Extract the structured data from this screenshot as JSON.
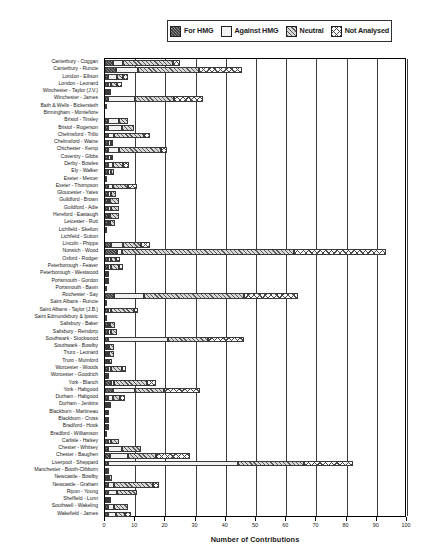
{
  "chart_data": {
    "type": "bar",
    "orientation": "horizontal",
    "stacked": true,
    "title": "",
    "xlabel": "Number of Contributions",
    "ylabel": "",
    "xlim": [
      0,
      100
    ],
    "xticks": [
      0,
      10,
      20,
      30,
      40,
      50,
      60,
      70,
      80,
      90,
      100
    ],
    "grid": true,
    "legend_position": "top",
    "series": [
      {
        "name": "For HMG",
        "key": "for",
        "pattern": "dark-hatch"
      },
      {
        "name": "Against HMG",
        "key": "against",
        "pattern": "light-dots"
      },
      {
        "name": "Neutral",
        "key": "neutral",
        "pattern": "diagonal-hatch"
      },
      {
        "name": "Not Analysed",
        "key": "notan",
        "pattern": "cross-hatch"
      }
    ],
    "categories": [
      "Canterbury - Coggan",
      "Canterbury - Runcie",
      "London - Ellison",
      "London - Leonard",
      "Winchester - Taylor (J.V.)",
      "Winchester - James",
      "Bath & Wells - Bickersteth",
      "Birmingham - Montefiore",
      "Bristol - Tinsley",
      "Bristol - Rogerson",
      "Chelmsford - Trillo",
      "Chelmsford - Waine",
      "Chichester - Kemp",
      "Coventry - Gibbs",
      "Derby - Bowles",
      "Ely - Walker",
      "Exeter - Mercer",
      "Exeter - Thompson",
      "Gloucester - Yates",
      "Guildford - Brown",
      "Guildford - Adie",
      "Hereford - Eastaugh",
      "Leicester - Rutt",
      "Lichfield - Skelton",
      "Lichfield - Sutton",
      "Lincoln - Phipps",
      "Norwich - Wood",
      "Oxford - Rodger",
      "Peterborough - Feaver",
      "Peterborough - Westwood",
      "Portsmouth - Gordon",
      "Portsmouth - Bavin",
      "Rochester - Say",
      "Saint Albans - Runcie",
      "Saint Albans - Taylor (J.B.)",
      "Saint Edmundsbury & Ipswic",
      "Salisbury - Baker",
      "Salisbury - Reindorp",
      "Southwark - Stockwood",
      "Southwark - Bowlby",
      "Truro - Leonard",
      "Truro - Mumford",
      "Worcester - Woods",
      "Worcester - Goodrich",
      "York - Blanch",
      "York - Habgood",
      "Durham - Habgood",
      "Durham - Jenkins",
      "Blackburn - Martineau",
      "Blackburn - Cross",
      "Bradford - Hook",
      "Bradford - Williamson",
      "Carlisle - Halsey",
      "Chester - Whitsey",
      "Chester - Baughen",
      "Liverpool - Sheppard",
      "Manchester - Booth-Clibborn",
      "Newcastle - Bowlby",
      "Newcastle - Graham",
      "Ripon - Young",
      "Sheffield - Lunn",
      "Southwell - Wakeling",
      "Wakefield - James"
    ],
    "rows": [
      {
        "category": "Canterbury - Coggan",
        "for": 2.5,
        "against": 3.5,
        "neutral": 16.5,
        "notan": 2.5,
        "total": 25.0
      },
      {
        "category": "Canterbury - Runcie",
        "for": 3.5,
        "against": 7.5,
        "neutral": 20.0,
        "notan": 14.5,
        "total": 45.5
      },
      {
        "category": "London - Ellison",
        "for": 1.0,
        "against": 3.0,
        "neutral": 2.0,
        "notan": 1.5,
        "total": 7.5
      },
      {
        "category": "London - Leonard",
        "for": 1.0,
        "against": 1.0,
        "neutral": 2.0,
        "notan": 1.5,
        "total": 5.5
      },
      {
        "category": "Winchester - Taylor (J.V.)",
        "for": 0.5,
        "against": 0.5,
        "neutral": 0.5,
        "notan": 0.0,
        "total": 1.5
      },
      {
        "category": "Winchester - James",
        "for": 1.0,
        "against": 9.0,
        "neutral": 13.0,
        "notan": 9.5,
        "total": 32.5
      },
      {
        "category": "Bath & Wells - Bickersteth",
        "for": 0.5,
        "against": 0.0,
        "neutral": 0.0,
        "notan": 0.0,
        "total": 0.5
      },
      {
        "category": "Birmingham - Montefiore",
        "for": 0.0,
        "against": 0.0,
        "neutral": 0.0,
        "notan": 0.0,
        "total": 0.0
      },
      {
        "category": "Bristol - Tinsley",
        "for": 1.0,
        "against": 3.5,
        "neutral": 3.0,
        "notan": 0.0,
        "total": 7.5
      },
      {
        "category": "Bristol - Rogerson",
        "for": 1.0,
        "against": 4.5,
        "neutral": 4.0,
        "notan": 0.0,
        "total": 9.5
      },
      {
        "category": "Chelmsford - Trillo",
        "for": 1.0,
        "against": 2.0,
        "neutral": 10.0,
        "notan": 2.0,
        "total": 15.0
      },
      {
        "category": "Chelmsford - Waine",
        "for": 1.0,
        "against": 1.0,
        "neutral": 0.5,
        "notan": 0.0,
        "total": 2.5
      },
      {
        "category": "Chichester - Kemp",
        "for": 1.0,
        "against": 3.5,
        "neutral": 14.0,
        "notan": 2.0,
        "total": 20.5
      },
      {
        "category": "Coventry - Gibbs",
        "for": 1.0,
        "against": 1.0,
        "neutral": 0.5,
        "notan": 0.0,
        "total": 2.5
      },
      {
        "category": "Derby - Bowles",
        "for": 1.0,
        "against": 1.5,
        "neutral": 3.5,
        "notan": 2.0,
        "total": 8.0
      },
      {
        "category": "Ely - Walker",
        "for": 1.0,
        "against": 1.0,
        "neutral": 1.0,
        "notan": 0.0,
        "total": 3.0
      },
      {
        "category": "Exeter - Mercer",
        "for": 0.5,
        "against": 0.0,
        "neutral": 0.0,
        "notan": 0.0,
        "total": 0.5
      },
      {
        "category": "Exeter - Thompson",
        "for": 1.0,
        "against": 1.5,
        "neutral": 5.0,
        "notan": 3.0,
        "total": 10.5
      },
      {
        "category": "Gloucester - Yates",
        "for": 1.0,
        "against": 1.0,
        "neutral": 1.5,
        "notan": 0.0,
        "total": 3.5
      },
      {
        "category": "Guildford - Brown",
        "for": 1.0,
        "against": 0.5,
        "neutral": 3.0,
        "notan": 0.0,
        "total": 4.5
      },
      {
        "category": "Guildford - Adie",
        "for": 1.0,
        "against": 1.0,
        "neutral": 2.5,
        "notan": 0.0,
        "total": 4.5
      },
      {
        "category": "Hereford - Eastaugh",
        "for": 1.0,
        "against": 0.5,
        "neutral": 3.0,
        "notan": 0.0,
        "total": 4.5
      },
      {
        "category": "Leicester - Rutt",
        "for": 1.0,
        "against": 0.5,
        "neutral": 1.5,
        "notan": 0.0,
        "total": 3.0
      },
      {
        "category": "Lichfield - Skelton",
        "for": 0.5,
        "against": 0.0,
        "neutral": 0.0,
        "notan": 0.0,
        "total": 0.5
      },
      {
        "category": "Lichfield - Sutton",
        "for": 0.0,
        "against": 0.0,
        "neutral": 0.0,
        "notan": 0.0,
        "total": 0.0
      },
      {
        "category": "Lincoln - Phipps",
        "for": 2.0,
        "against": 4.0,
        "neutral": 6.0,
        "notan": 3.0,
        "total": 15.0
      },
      {
        "category": "Norwich - Wood",
        "for": 4.0,
        "against": 1.5,
        "neutral": 57.0,
        "notan": 30.5,
        "total": 93.0
      },
      {
        "category": "Oxford - Rodger",
        "for": 1.0,
        "against": 1.0,
        "neutral": 1.5,
        "notan": 1.5,
        "total": 5.0
      },
      {
        "category": "Peterborough - Feaver",
        "for": 1.0,
        "against": 1.0,
        "neutral": 2.5,
        "notan": 1.5,
        "total": 6.0
      },
      {
        "category": "Peterborough - Westwood",
        "for": 0.5,
        "against": 0.0,
        "neutral": 0.5,
        "notan": 0.0,
        "total": 1.0
      },
      {
        "category": "Portsmouth - Gordon",
        "for": 0.5,
        "against": 0.0,
        "neutral": 0.5,
        "notan": 0.0,
        "total": 1.0
      },
      {
        "category": "Portsmouth - Bavin",
        "for": 0.5,
        "against": 0.0,
        "neutral": 0.0,
        "notan": 0.0,
        "total": 0.5
      },
      {
        "category": "Rochester - Say",
        "for": 3.0,
        "against": 10.0,
        "neutral": 33.0,
        "notan": 18.0,
        "total": 64.0
      },
      {
        "category": "Saint Albans - Runcie",
        "for": 0.5,
        "against": 0.0,
        "neutral": 0.0,
        "notan": 0.0,
        "total": 0.5
      },
      {
        "category": "Saint Albans - Taylor (J.B.)",
        "for": 1.0,
        "against": 1.0,
        "neutral": 7.5,
        "notan": 1.5,
        "total": 11.0
      },
      {
        "category": "Saint Edmundsbury & Ipswic",
        "for": 0.5,
        "against": 0.0,
        "neutral": 0.0,
        "notan": 0.0,
        "total": 0.5
      },
      {
        "category": "Salisbury - Baker",
        "for": 1.0,
        "against": 0.5,
        "neutral": 1.5,
        "notan": 0.0,
        "total": 3.0
      },
      {
        "category": "Salisbury - Reindorp",
        "for": 1.0,
        "against": 1.0,
        "neutral": 2.0,
        "notan": 0.0,
        "total": 4.0
      },
      {
        "category": "Southwark - Stockwood",
        "for": 1.0,
        "against": 20.0,
        "neutral": 13.0,
        "notan": 12.0,
        "total": 46.0
      },
      {
        "category": "Southwark - Bowlby",
        "for": 0.5,
        "against": 0.5,
        "neutral": 1.5,
        "notan": 0.0,
        "total": 2.5
      },
      {
        "category": "Truro - Leonard",
        "for": 0.5,
        "against": 0.5,
        "neutral": 1.5,
        "notan": 0.0,
        "total": 2.5
      },
      {
        "category": "Truro - Mumford",
        "for": 0.5,
        "against": 0.5,
        "neutral": 1.0,
        "notan": 0.0,
        "total": 2.0
      },
      {
        "category": "Worcester - Woods",
        "for": 1.0,
        "against": 1.0,
        "neutral": 3.5,
        "notan": 1.5,
        "total": 7.0
      },
      {
        "category": "Worcester - Goodrich",
        "for": 0.5,
        "against": 0.0,
        "neutral": 0.5,
        "notan": 0.0,
        "total": 1.0
      },
      {
        "category": "York - Blanch",
        "for": 2.0,
        "against": 1.0,
        "neutral": 11.0,
        "notan": 3.0,
        "total": 17.0
      },
      {
        "category": "York - Habgood",
        "for": 2.5,
        "against": 7.5,
        "neutral": 9.5,
        "notan": 12.0,
        "total": 31.5
      },
      {
        "category": "Durham - Habgood",
        "for": 1.0,
        "against": 1.5,
        "neutral": 2.5,
        "notan": 1.5,
        "total": 6.5
      },
      {
        "category": "Durham - Jenkins",
        "for": 0.5,
        "against": 0.5,
        "neutral": 0.5,
        "notan": 0.0,
        "total": 1.5
      },
      {
        "category": "Blackburn - Martineau",
        "for": 0.5,
        "against": 0.0,
        "neutral": 0.5,
        "notan": 0.0,
        "total": 1.0
      },
      {
        "category": "Blackburn - Cross",
        "for": 0.5,
        "against": 0.0,
        "neutral": 0.5,
        "notan": 0.0,
        "total": 1.0
      },
      {
        "category": "Bradford - Hook",
        "for": 0.5,
        "against": 0.0,
        "neutral": 0.5,
        "notan": 0.0,
        "total": 1.0
      },
      {
        "category": "Bradford - Williamson",
        "for": 0.5,
        "against": 0.0,
        "neutral": 0.0,
        "notan": 0.0,
        "total": 0.5
      },
      {
        "category": "Carlisle - Halsey",
        "for": 1.0,
        "against": 1.0,
        "neutral": 2.5,
        "notan": 0.0,
        "total": 4.5
      },
      {
        "category": "Chester - Whitsey",
        "for": 1.0,
        "against": 4.5,
        "neutral": 6.5,
        "notan": 0.0,
        "total": 12.0
      },
      {
        "category": "Chester - Baughen",
        "for": 1.5,
        "against": 6.0,
        "neutral": 9.5,
        "notan": 11.0,
        "total": 28.0
      },
      {
        "category": "Liverpool - Sheppard",
        "for": 1.0,
        "against": 43.0,
        "neutral": 22.0,
        "notan": 16.0,
        "total": 82.0
      },
      {
        "category": "Manchester - Booth-Clibborn",
        "for": 0.5,
        "against": 0.5,
        "neutral": 0.0,
        "notan": 0.0,
        "total": 1.0
      },
      {
        "category": "Newcastle - Bowlby",
        "for": 0.5,
        "against": 0.5,
        "neutral": 1.0,
        "notan": 0.0,
        "total": 2.0
      },
      {
        "category": "Newcastle - Graham",
        "for": 1.0,
        "against": 2.0,
        "neutral": 13.0,
        "notan": 2.0,
        "total": 18.0
      },
      {
        "category": "Ripon - Young",
        "for": 1.0,
        "against": 3.0,
        "neutral": 6.5,
        "notan": 0.0,
        "total": 10.5
      },
      {
        "category": "Sheffield - Lunn",
        "for": 0.5,
        "against": 0.5,
        "neutral": 0.5,
        "notan": 0.0,
        "total": 1.5
      },
      {
        "category": "Southwell - Wakeling",
        "for": 1.0,
        "against": 2.0,
        "neutral": 4.5,
        "notan": 0.0,
        "total": 7.5
      },
      {
        "category": "Wakefield - James",
        "for": 1.0,
        "against": 2.5,
        "neutral": 3.0,
        "notan": 2.0,
        "total": 8.5
      }
    ]
  }
}
